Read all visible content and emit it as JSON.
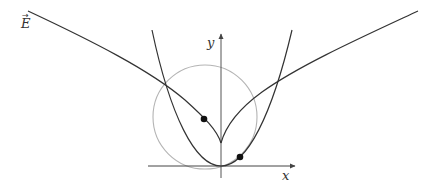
{
  "diagram": {
    "labels": {
      "field": "E",
      "field_arrow": "→",
      "x_axis": "x",
      "y_axis": "y"
    },
    "colors": {
      "curve": "#333333",
      "circle": "#b0b0b0",
      "axis": "#444444",
      "point": "#111111",
      "background": "#ffffff"
    },
    "elements": [
      {
        "type": "axis",
        "name": "x-axis"
      },
      {
        "type": "axis",
        "name": "y-axis"
      },
      {
        "type": "curve",
        "name": "parabola",
        "description": "upward parabola with vertex at origin"
      },
      {
        "type": "curve",
        "name": "cusp-curve",
        "description": "field-line curve with cusp on y-axis above origin"
      },
      {
        "type": "circle",
        "name": "gray-circle"
      },
      {
        "type": "point",
        "name": "point-on-cusp-curve"
      },
      {
        "type": "point",
        "name": "point-on-parabola"
      }
    ]
  }
}
